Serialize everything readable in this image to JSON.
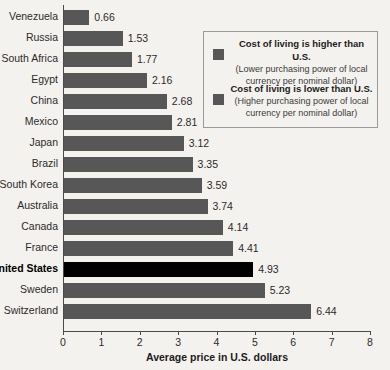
{
  "chart_data": {
    "type": "bar",
    "orientation": "horizontal",
    "title": "",
    "xlabel": "Average price in U.S. dollars",
    "ylabel": "",
    "xlim": [
      0,
      8
    ],
    "xticks": [
      0,
      1,
      2,
      3,
      4,
      5,
      6,
      7,
      8
    ],
    "grid": false,
    "categories": [
      "Venezuela",
      "Russia",
      "South Africa",
      "Egypt",
      "China",
      "Mexico",
      "Japan",
      "Brazil",
      "South Korea",
      "Australia",
      "Canada",
      "France",
      "United States",
      "Sweden",
      "Switzerland"
    ],
    "values": [
      0.66,
      1.53,
      1.77,
      2.16,
      2.68,
      2.81,
      3.12,
      3.35,
      3.59,
      3.74,
      4.14,
      4.41,
      4.93,
      5.23,
      6.44
    ],
    "highlight_category": "United States",
    "colors": {
      "bar": "#575757",
      "highlight_bar": "#000000",
      "background": "#f4f2ee",
      "axis": "#4a4a4a",
      "text": "#2b2b2b"
    },
    "legend": {
      "position": "top-right",
      "entries": [
        {
          "swatch": "#575757",
          "title": "Cost of living is higher than U.S.",
          "subtitle_line1": "(Lower purchasing power of local",
          "subtitle_line2": "currency per nominal dollar)"
        },
        {
          "swatch": "#575757",
          "title": "Cost of living is lower than U.S.",
          "subtitle_line1": "(Higher purchasing power of local",
          "subtitle_line2": "currency per nominal dollar)"
        }
      ]
    }
  }
}
